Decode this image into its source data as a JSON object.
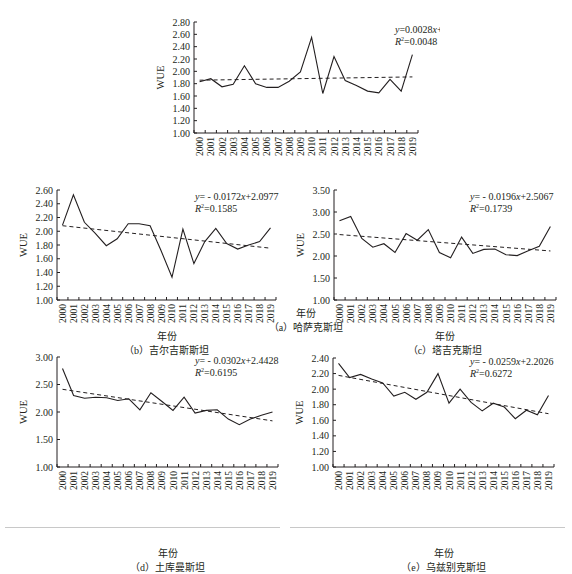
{
  "chart_data": [
    {
      "id": "a",
      "type": "line",
      "caption": "（a）哈萨克斯坦",
      "xlabel": "年份",
      "ylabel": "WUE",
      "ylim": [
        1.0,
        2.8
      ],
      "yticks": [
        "1.00",
        "1.20",
        "1.40",
        "1.60",
        "1.80",
        "2.00",
        "2.20",
        "2.40",
        "2.60",
        "2.80"
      ],
      "categories": [
        "2000",
        "2001",
        "2002",
        "2003",
        "2004",
        "2005",
        "2006",
        "2007",
        "2008",
        "2009",
        "2010",
        "2011",
        "2012",
        "2013",
        "2014",
        "2015",
        "2016",
        "2017",
        "2018",
        "2019"
      ],
      "series": [
        {
          "name": "WUE",
          "style": "solid",
          "values": [
            1.83,
            1.88,
            1.75,
            1.79,
            2.09,
            1.8,
            1.74,
            1.74,
            1.84,
            1.99,
            2.55,
            1.64,
            2.24,
            1.85,
            1.77,
            1.68,
            1.65,
            1.87,
            1.68,
            2.27
          ]
        },
        {
          "name": "Trend",
          "style": "dashed",
          "slope": 0.0028,
          "intercept": 1.8536
        }
      ],
      "equation": "y=0.0028x+1.8536",
      "r2": "R²=0.0048",
      "grid": false
    },
    {
      "id": "b",
      "type": "line",
      "caption": "（b）吉尔吉斯斯坦",
      "xlabel": "年份",
      "ylabel": "WUE",
      "ylim": [
        1.0,
        2.6
      ],
      "yticks": [
        "1.00",
        "1.20",
        "1.40",
        "1.60",
        "1.80",
        "2.00",
        "2.20",
        "2.40",
        "2.60"
      ],
      "categories": [
        "2000",
        "2001",
        "2002",
        "2003",
        "2004",
        "2005",
        "2006",
        "2007",
        "2008",
        "2009",
        "2010",
        "2011",
        "2012",
        "2013",
        "2014",
        "2015",
        "2016",
        "2017",
        "2018",
        "2019"
      ],
      "series": [
        {
          "name": "WUE",
          "style": "solid",
          "values": [
            2.09,
            2.53,
            2.13,
            1.97,
            1.79,
            1.89,
            2.11,
            2.11,
            2.08,
            1.72,
            1.33,
            2.03,
            1.53,
            1.85,
            2.04,
            1.82,
            1.74,
            1.8,
            1.85,
            2.05
          ]
        },
        {
          "name": "Trend",
          "style": "dashed",
          "slope": -0.0172,
          "intercept": 2.0977
        }
      ],
      "equation": "y= - 0.0172x+2.0977",
      "r2": "R²=0.1585",
      "grid": false
    },
    {
      "id": "c",
      "type": "line",
      "caption": "（c）塔吉克斯坦",
      "xlabel": "年份",
      "ylabel": "WUE",
      "ylim": [
        1.0,
        3.5
      ],
      "yticks": [
        "1.00",
        "1.50",
        "2.00",
        "2.50",
        "3.00",
        "3.50"
      ],
      "categories": [
        "2000",
        "2001",
        "2002",
        "2003",
        "2004",
        "2005",
        "2006",
        "2007",
        "2008",
        "2009",
        "2010",
        "2011",
        "2012",
        "2013",
        "2014",
        "2015",
        "2016",
        "2017",
        "2018",
        "2019"
      ],
      "series": [
        {
          "name": "WUE",
          "style": "solid",
          "values": [
            2.8,
            2.9,
            2.4,
            2.2,
            2.28,
            2.08,
            2.51,
            2.36,
            2.6,
            2.08,
            1.96,
            2.43,
            2.06,
            2.15,
            2.16,
            2.03,
            2.01,
            2.12,
            2.22,
            2.67
          ]
        },
        {
          "name": "Trend",
          "style": "dashed",
          "slope": -0.0196,
          "intercept": 2.5067
        }
      ],
      "equation": "y= - 0.0196x+2.5067",
      "r2": "R²=0.1739",
      "grid": false
    },
    {
      "id": "d",
      "type": "line",
      "caption": "（d）土库曼斯坦",
      "xlabel": "年份",
      "ylabel": "WUE",
      "ylim": [
        1.0,
        3.0
      ],
      "yticks": [
        "1.00",
        "1.50",
        "2.00",
        "2.50",
        "3.00"
      ],
      "categories": [
        "2000",
        "2001",
        "2002",
        "2003",
        "2004",
        "2005",
        "2006",
        "2007",
        "2008",
        "2009",
        "2010",
        "2011",
        "2012",
        "2013",
        "2014",
        "2015",
        "2016",
        "2017",
        "2018",
        "2019"
      ],
      "series": [
        {
          "name": "WUE",
          "style": "solid",
          "values": [
            2.79,
            2.3,
            2.25,
            2.27,
            2.26,
            2.21,
            2.24,
            2.04,
            2.35,
            2.19,
            2.03,
            2.27,
            1.98,
            2.03,
            2.04,
            1.87,
            1.77,
            1.87,
            1.94,
            2.0
          ]
        },
        {
          "name": "Trend",
          "style": "dashed",
          "slope": -0.0302,
          "intercept": 2.4428
        }
      ],
      "equation": "y= - 0.0302x+2.4428",
      "r2": "R²=0.6195",
      "grid": false
    },
    {
      "id": "e",
      "type": "line",
      "caption": "（e）乌兹别克斯坦",
      "xlabel": "年份",
      "ylabel": "WUE",
      "ylim": [
        1.0,
        2.4
      ],
      "yticks": [
        "1.00",
        "1.20",
        "1.40",
        "1.60",
        "1.80",
        "2.00",
        "2.20",
        "2.40"
      ],
      "categories": [
        "2000",
        "2001",
        "2002",
        "2003",
        "2004",
        "2005",
        "2006",
        "2007",
        "2008",
        "2009",
        "2010",
        "2011",
        "2012",
        "2013",
        "2014",
        "2015",
        "2016",
        "2017",
        "2018",
        "2019"
      ],
      "series": [
        {
          "name": "WUE",
          "style": "solid",
          "values": [
            2.33,
            2.15,
            2.19,
            2.13,
            2.08,
            1.91,
            1.96,
            1.87,
            1.96,
            2.2,
            1.82,
            2.0,
            1.83,
            1.72,
            1.82,
            1.77,
            1.62,
            1.73,
            1.67,
            1.92
          ]
        },
        {
          "name": "Trend",
          "style": "dashed",
          "slope": -0.0259,
          "intercept": 2.2026
        }
      ],
      "equation": "y= - 0.0259x+2.2026",
      "r2": "R²=0.6272",
      "grid": false
    }
  ]
}
